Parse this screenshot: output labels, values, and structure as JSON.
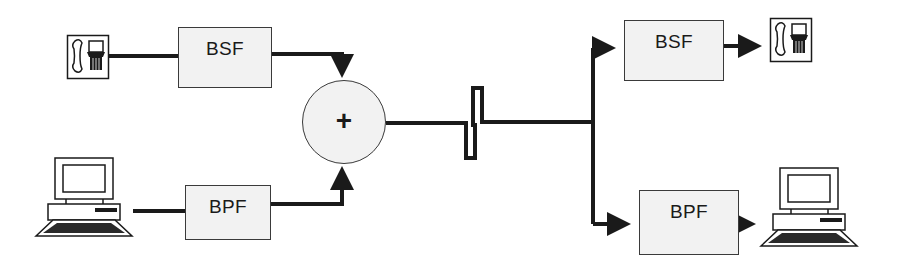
{
  "diagram": {
    "title": "",
    "colors": {
      "line": "#1a1a1a",
      "box_fill": "#f2f2f2",
      "box_border": "#3a3a3a"
    },
    "sources": [
      {
        "id": "phone-left",
        "type": "telephone",
        "icon": "telephone-icon"
      },
      {
        "id": "pc-left",
        "type": "computer",
        "icon": "computer-icon"
      }
    ],
    "filters": {
      "tx_bsf": {
        "label": "BSF"
      },
      "tx_bpf": {
        "label": "BPF"
      },
      "rx_bsf": {
        "label": "BSF"
      },
      "rx_bpf": {
        "label": "BPF"
      }
    },
    "combiner": {
      "symbol": "+",
      "name": "summing junction"
    },
    "channel": {
      "name": "transmission line break"
    },
    "sinks": [
      {
        "id": "phone-right",
        "type": "telephone",
        "icon": "telephone-icon"
      },
      {
        "id": "pc-right",
        "type": "computer",
        "icon": "computer-icon"
      }
    ],
    "connections": [
      {
        "from": "phone-left",
        "to": "tx_bsf"
      },
      {
        "from": "tx_bsf",
        "to": "combiner"
      },
      {
        "from": "pc-left",
        "to": "tx_bpf"
      },
      {
        "from": "tx_bpf",
        "to": "combiner"
      },
      {
        "from": "combiner",
        "to": "channel"
      },
      {
        "from": "channel",
        "to": "rx_bsf"
      },
      {
        "from": "channel",
        "to": "rx_bpf"
      },
      {
        "from": "rx_bsf",
        "to": "phone-right"
      },
      {
        "from": "rx_bpf",
        "to": "pc-right"
      }
    ]
  }
}
